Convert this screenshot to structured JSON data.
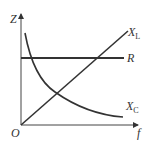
{
  "diagram": {
    "axes": {
      "y_label": "Z",
      "x_label": "f",
      "origin_label": "O"
    },
    "curves": [
      {
        "name": "X_L",
        "label_main": "X",
        "label_sub": "L",
        "shape": "straight line through origin, increasing"
      },
      {
        "name": "R",
        "label_main": "R",
        "label_sub": "",
        "shape": "horizontal line, constant"
      },
      {
        "name": "X_C",
        "label_main": "X",
        "label_sub": "C",
        "shape": "hyperbolic decreasing curve"
      }
    ],
    "colors": {
      "line": "#333333",
      "background": "#ffffff"
    }
  }
}
